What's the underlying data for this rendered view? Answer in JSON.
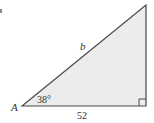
{
  "diagram": {
    "type": "right-triangle",
    "vertex_label": "A",
    "angle_label": "38°",
    "hypotenuse_label": "b",
    "base_label": "52",
    "right_angle_marker": true,
    "colors": {
      "fill": "#ececec",
      "stroke": "#4a4a4a",
      "text": "#333333"
    }
  }
}
